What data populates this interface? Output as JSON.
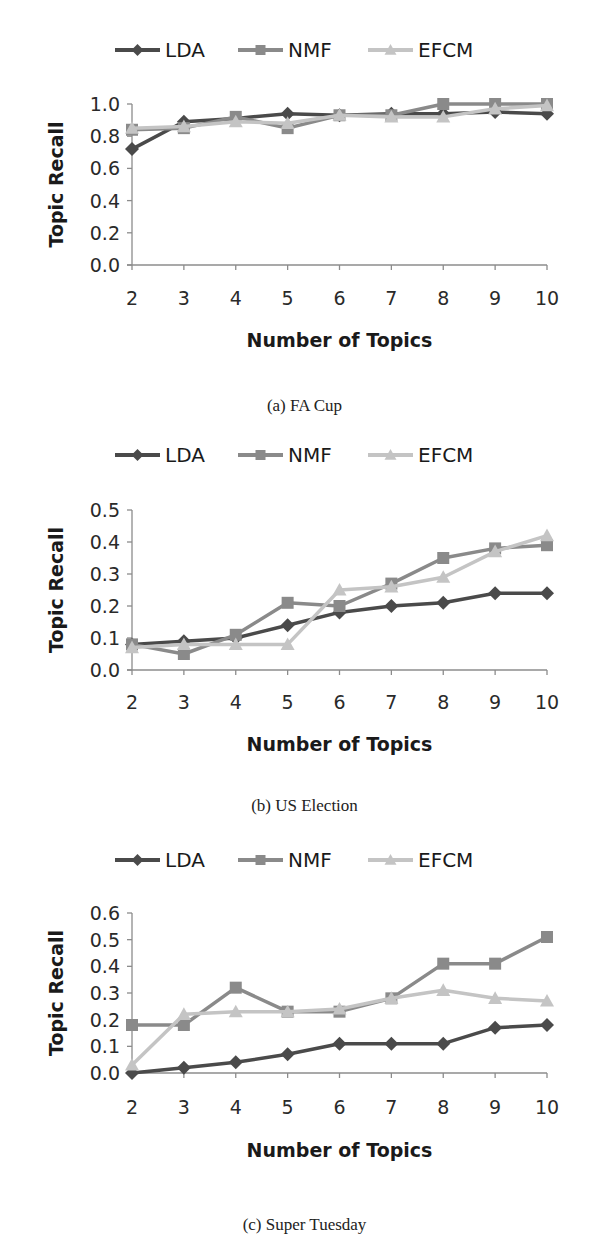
{
  "legend": {
    "items": [
      {
        "name": "LDA",
        "marker": "diamond",
        "color": "#4a4a4a"
      },
      {
        "name": "NMF",
        "marker": "square",
        "color": "#8a8a8a"
      },
      {
        "name": "EFCM",
        "marker": "triangle",
        "color": "#c4c4c4"
      }
    ]
  },
  "captions": {
    "a": "(a) FA Cup",
    "b": "(b) US Election",
    "c": "(c) Super Tuesday"
  },
  "chart_data": [
    {
      "type": "line",
      "title": "(a) FA Cup",
      "xlabel": "Number of Topics",
      "ylabel": "Topic Recall",
      "x": [
        2,
        3,
        4,
        5,
        6,
        7,
        8,
        9,
        10
      ],
      "ylim": [
        0.0,
        1.0
      ],
      "yticks": [
        "0.0",
        "0.2",
        "0.4",
        "0.6",
        "0.8",
        "1.0"
      ],
      "grid": false,
      "legend_position": "top",
      "series": [
        {
          "name": "LDA",
          "values": [
            0.72,
            0.89,
            0.91,
            0.94,
            0.93,
            0.94,
            0.94,
            0.95,
            0.94
          ]
        },
        {
          "name": "NMF",
          "values": [
            0.84,
            0.85,
            0.92,
            0.85,
            0.93,
            0.93,
            1.0,
            1.0,
            1.0
          ]
        },
        {
          "name": "EFCM",
          "values": [
            0.85,
            0.86,
            0.89,
            0.88,
            0.93,
            0.92,
            0.92,
            0.97,
            0.99
          ]
        }
      ]
    },
    {
      "type": "line",
      "title": "(b) US Election",
      "xlabel": "Number of Topics",
      "ylabel": "Topic Recall",
      "x": [
        2,
        3,
        4,
        5,
        6,
        7,
        8,
        9,
        10
      ],
      "ylim": [
        0.0,
        0.5
      ],
      "yticks": [
        "0.0",
        "0.1",
        "0.2",
        "0.3",
        "0.4",
        "0.5"
      ],
      "grid": false,
      "legend_position": "top",
      "series": [
        {
          "name": "LDA",
          "values": [
            0.08,
            0.09,
            0.1,
            0.14,
            0.18,
            0.2,
            0.21,
            0.24,
            0.24
          ]
        },
        {
          "name": "NMF",
          "values": [
            0.08,
            0.05,
            0.11,
            0.21,
            0.2,
            0.27,
            0.35,
            0.38,
            0.39
          ]
        },
        {
          "name": "EFCM",
          "values": [
            0.07,
            0.08,
            0.08,
            0.08,
            0.25,
            0.26,
            0.29,
            0.37,
            0.42
          ]
        }
      ]
    },
    {
      "type": "line",
      "title": "(c) Super Tuesday",
      "xlabel": "Number of Topics",
      "ylabel": "Topic Recall",
      "x": [
        2,
        3,
        4,
        5,
        6,
        7,
        8,
        9,
        10
      ],
      "ylim": [
        0.0,
        0.6
      ],
      "yticks": [
        "0.0",
        "0.1",
        "0.2",
        "0.3",
        "0.4",
        "0.5",
        "0.6"
      ],
      "grid": false,
      "legend_position": "top",
      "series": [
        {
          "name": "LDA",
          "values": [
            0.0,
            0.02,
            0.04,
            0.07,
            0.11,
            0.11,
            0.11,
            0.17,
            0.18
          ]
        },
        {
          "name": "NMF",
          "values": [
            0.18,
            0.18,
            0.32,
            0.23,
            0.23,
            0.28,
            0.41,
            0.41,
            0.51
          ]
        },
        {
          "name": "EFCM",
          "values": [
            0.03,
            0.22,
            0.23,
            0.23,
            0.24,
            0.28,
            0.31,
            0.28,
            0.27
          ]
        }
      ]
    }
  ]
}
